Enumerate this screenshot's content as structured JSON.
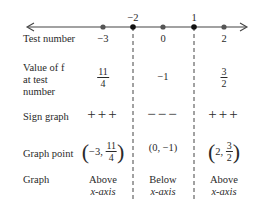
{
  "number_line": {
    "critical_points": [
      {
        "label": "−2",
        "x": 133
      },
      {
        "label": "1",
        "x": 194
      }
    ],
    "test_points_x": [
      103,
      163,
      224
    ]
  },
  "rows": {
    "test_number": {
      "label": "Test number",
      "values": [
        "−3",
        "0",
        "2"
      ]
    },
    "value_of_f": {
      "label_lines": [
        "Value of f",
        "at test",
        "number"
      ],
      "values": [
        {
          "type": "fraction",
          "num": "11",
          "den": "4"
        },
        {
          "type": "text",
          "text": "−1"
        },
        {
          "type": "fraction",
          "num": "3",
          "den": "2"
        }
      ]
    },
    "sign_graph": {
      "label": "Sign graph",
      "values": [
        "+++",
        "−−−",
        "+++"
      ]
    },
    "graph_point": {
      "label": "Graph point",
      "values": [
        {
          "prefix": "−3,",
          "num": "11",
          "den": "4"
        },
        {
          "text": "(0, −1)"
        },
        {
          "prefix": "2,",
          "num": "3",
          "den": "2"
        }
      ]
    },
    "graph": {
      "label": "Graph",
      "values": [
        [
          "Above",
          "x-axis"
        ],
        [
          "Below",
          "x-axis"
        ],
        [
          "Above",
          "x-axis"
        ]
      ]
    }
  }
}
